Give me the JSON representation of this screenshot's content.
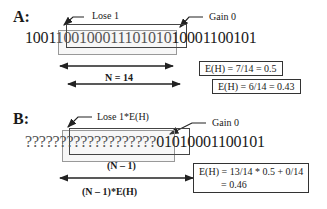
{
  "panel_a": {
    "label": "A:",
    "prefix": "1001",
    "window": "1001000111010",
    "window_tail": "10",
    "suffix": "10001100101",
    "lose_label": "Lose 1",
    "gain_label": "Gain 0",
    "n_label": "N = 14",
    "entropy_1": "E(H) = 7/14 = 0.5",
    "entropy_2": "E(H) = 6/14 = 0.43"
  },
  "panel_b": {
    "label": "B:",
    "prefix": "?????",
    "window": "??????????????",
    "suffix": "01010001100101",
    "lose_label": "Lose 1*E(H)",
    "gain_label": "Gain 0",
    "n_minus_label": "(N – 1)",
    "n_minus_eh_label": "(N – 1)*E(H)",
    "entropy_line1": "E(H) = 13/14 * 0.5 + 0/14",
    "entropy_line2": "= 0.46"
  }
}
